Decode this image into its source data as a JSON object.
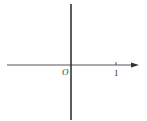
{
  "diagram": {
    "type": "coordinate-axes",
    "origin_label": "O",
    "tick_label": "1",
    "colors": {
      "axis": "#444444",
      "vertical_line": "#333333",
      "text": "#333333"
    }
  }
}
